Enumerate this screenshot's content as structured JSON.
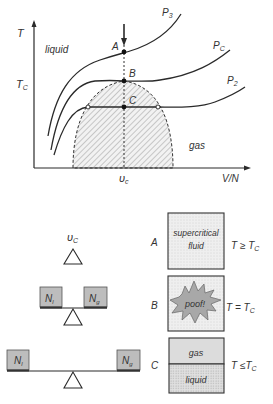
{
  "phase_diagram": {
    "y_axis_label": "T",
    "y_tick_label": "T",
    "y_tick_sub": "C",
    "x_axis_label": "V/N",
    "x_tick_label": "υ",
    "x_tick_sub": "c",
    "region_liquid": "liquid",
    "region_gas": "gas",
    "isobars": [
      {
        "name": "P",
        "sub": "3"
      },
      {
        "name": "P",
        "sub": "C"
      },
      {
        "name": "P",
        "sub": "2"
      }
    ],
    "points": [
      {
        "label": "A"
      },
      {
        "label": "B"
      },
      {
        "label": "C"
      }
    ]
  },
  "balance_section": {
    "pivot_label": "υ",
    "pivot_sub": "C",
    "balance_middle": {
      "left": "N",
      "left_sub": "l",
      "right": "N",
      "right_sub": "g"
    },
    "balance_bottom": {
      "left": "N",
      "left_sub": "l",
      "right": "N",
      "right_sub": "g"
    }
  },
  "states": [
    {
      "label": "A",
      "box_text_1": "supercritical",
      "box_text_2": "fluid",
      "condition": "T ≥ T",
      "condition_sub": "C"
    },
    {
      "label": "B",
      "box_text_1": "poof!",
      "condition": "T = T",
      "condition_sub": "C"
    },
    {
      "label": "C",
      "box_top": "gas",
      "box_bottom": "liquid",
      "condition": "T ≤T",
      "condition_sub": "C"
    }
  ],
  "colors": {
    "ink": "#2a2a2a",
    "box_fill": "#e8e8e8",
    "weight_fill": "#bdbdbd",
    "burst_fill": "#a8a8a8",
    "gas_fill": "#dcdcdc"
  }
}
